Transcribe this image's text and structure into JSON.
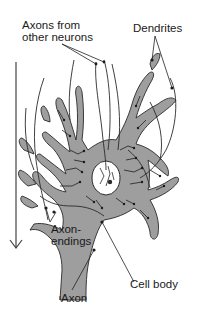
{
  "diagram": {
    "labels": {
      "axons_from_other_neurons": "Axons from\nother neurons",
      "dendrites": "Dendrites",
      "axon_endings": "Axon-\nendings",
      "axon": "Axon",
      "cell_body": "Cell body"
    },
    "colors": {
      "cell_fill": "#9e9e9e",
      "outline": "#2a2a2a",
      "text": "#1a1a1a",
      "nucleus_fill": "#ffffff",
      "background": "#ffffff"
    },
    "direction_arrow": "down"
  }
}
